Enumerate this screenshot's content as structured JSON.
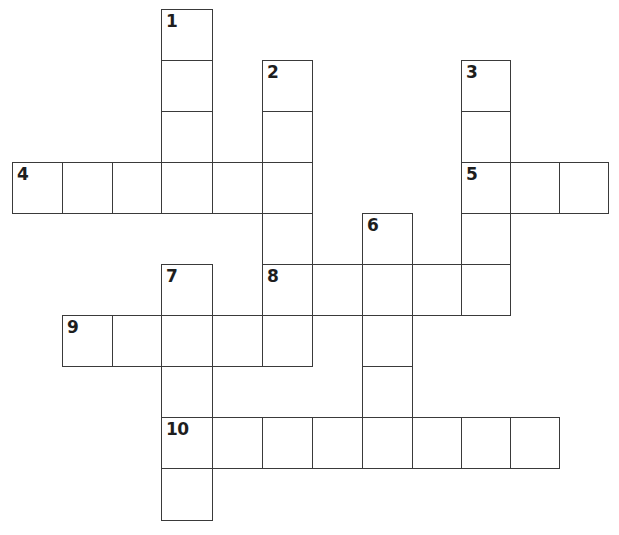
{
  "puzzle": {
    "type": "crossword",
    "grid": {
      "cols": 12,
      "rows": 10,
      "col_x": [
        12,
        62,
        112,
        161,
        212,
        262,
        312,
        362,
        412,
        461,
        510,
        559,
        608
      ],
      "row_y": [
        9,
        60,
        111,
        162,
        213,
        264,
        315,
        366,
        417,
        468,
        520
      ],
      "line_color": "#3a3a3a",
      "cell_fill": "#ffffff"
    },
    "entries": [
      {
        "number": "1",
        "direction": "down",
        "row": 0,
        "col": 3,
        "length": 4
      },
      {
        "number": "2",
        "direction": "down",
        "row": 1,
        "col": 5,
        "length": 6
      },
      {
        "number": "3",
        "direction": "down",
        "row": 1,
        "col": 9,
        "length": 5
      },
      {
        "number": "4",
        "direction": "across",
        "row": 3,
        "col": 0,
        "length": 6
      },
      {
        "number": "5",
        "direction": "across",
        "row": 3,
        "col": 9,
        "length": 3
      },
      {
        "number": "6",
        "direction": "down",
        "row": 4,
        "col": 7,
        "length": 5
      },
      {
        "number": "7",
        "direction": "down",
        "row": 5,
        "col": 3,
        "length": 5
      },
      {
        "number": "8",
        "direction": "across",
        "row": 5,
        "col": 5,
        "length": 5
      },
      {
        "number": "9",
        "direction": "across",
        "row": 6,
        "col": 1,
        "length": 4
      },
      {
        "number": "10",
        "direction": "across",
        "row": 8,
        "col": 3,
        "length": 8
      }
    ]
  }
}
